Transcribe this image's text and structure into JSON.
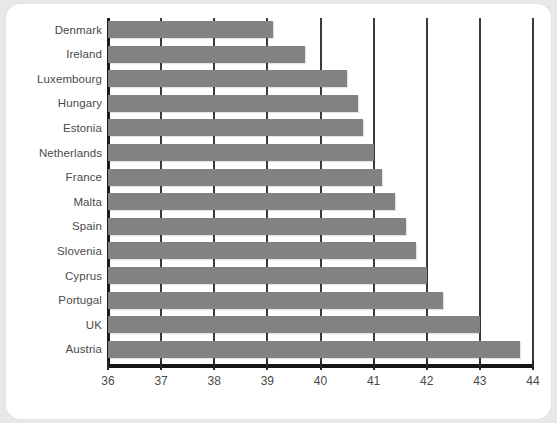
{
  "chart_data": {
    "type": "bar",
    "orientation": "horizontal",
    "title": "",
    "subtitle": "",
    "xlabel": "",
    "ylabel": "",
    "xlim": [
      36,
      44
    ],
    "ylim": null,
    "grid": true,
    "legend": null,
    "legend_position": "none",
    "xticks": [
      36,
      37,
      38,
      39,
      40,
      41,
      42,
      43,
      44
    ],
    "xtick_labels": [
      "36",
      "37",
      "38",
      "39",
      "40",
      "41",
      "42",
      "43",
      "44"
    ],
    "bar_color": "#828282",
    "axis_color": "#1c1c1c",
    "grid_color": "#3a3a3a",
    "label_color": "#4a4a4a",
    "background_color": "#ffffff",
    "page_background_color": "#e8e8e8",
    "categories": [
      "Denmark",
      "Ireland",
      "Luxembourg",
      "Hungary",
      "Estonia",
      "Netherlands",
      "France",
      "Malta",
      "Spain",
      "Slovenia",
      "Cyprus",
      "Portugal",
      "UK",
      "Austria"
    ],
    "values": [
      39.1,
      39.7,
      40.5,
      40.7,
      40.8,
      41.0,
      41.15,
      41.4,
      41.6,
      41.8,
      42.0,
      42.3,
      43.0,
      43.75
    ]
  }
}
